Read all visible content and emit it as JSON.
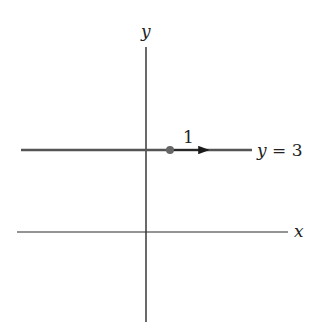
{
  "diagram": {
    "axes": {
      "x_label": "x",
      "y_label": "y"
    },
    "line": {
      "label_var": "y",
      "label_eq": " = ",
      "label_value": "3"
    },
    "vector": {
      "label": "1"
    },
    "colors": {
      "axis": "#2a2a2a",
      "line": "#555555",
      "dot": "#666666",
      "vector": "#1a1a1a"
    }
  }
}
